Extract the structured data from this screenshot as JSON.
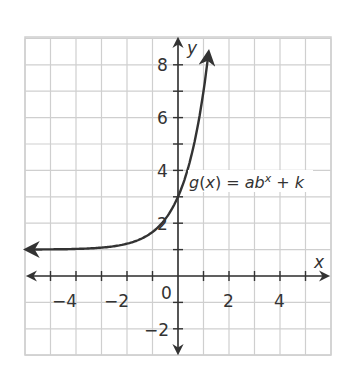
{
  "chart_data": {
    "type": "line",
    "title": "",
    "xlabel": "x",
    "ylabel": "y",
    "xlim": [
      -6,
      6
    ],
    "ylim": [
      -3,
      9
    ],
    "grid": true,
    "x_tick_labels": [
      "-4",
      "-2",
      "2",
      "4"
    ],
    "x_tick_values": [
      -4,
      -2,
      2,
      4
    ],
    "y_tick_labels": [
      "8",
      "6",
      "4",
      "2",
      "-2"
    ],
    "y_tick_values": [
      8,
      6,
      4,
      2,
      -2
    ],
    "origin_label": "0",
    "annotation": "g(x) = ab^x + k",
    "series": [
      {
        "name": "g(x) = ab^x + k",
        "asymptote": 1,
        "y_intercept": 3,
        "x": [
          -6,
          -5,
          -4,
          -3,
          -2,
          -1,
          0,
          0.5,
          1,
          1.2
        ],
        "values": [
          1.0,
          1.01,
          1.02,
          1.07,
          1.22,
          1.67,
          3.0,
          4.46,
          7.0,
          8.5
        ]
      }
    ]
  },
  "labels": {
    "x_axis": "x",
    "y_axis": "y",
    "origin": "0",
    "eq_g": "g",
    "eq_open": "(",
    "eq_x": "x",
    "eq_close": ") = ",
    "eq_a": "a",
    "eq_b": "b",
    "eq_exp": "x",
    "eq_plus": " + ",
    "eq_k": "k",
    "x_ticks": [
      "−4",
      "−2",
      "2",
      "4"
    ],
    "y_ticks": [
      "8",
      "6",
      "4",
      "2",
      "−2"
    ]
  },
  "colors": {
    "grid": "#cfcfcf",
    "axis": "#333333",
    "curve": "#333333",
    "background": "#ffffff"
  }
}
